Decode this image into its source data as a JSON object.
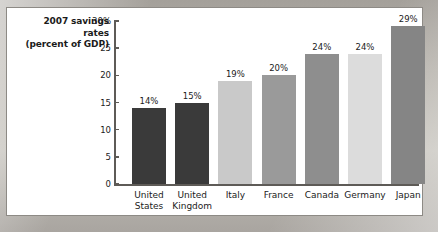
{
  "chart_data": {
    "type": "bar",
    "title": "2007 savings rates (percent of GDP)",
    "title_lines": [
      "2007 savings",
      "rates",
      "(percent of GDP)"
    ],
    "xlabel": "",
    "ylabel": "percent of GDP",
    "ylim": [
      0,
      30
    ],
    "yticks": [
      0,
      5,
      10,
      15,
      20,
      25,
      30
    ],
    "ytick_labels": [
      "0",
      "5",
      "10",
      "15",
      "20",
      "25",
      "30%"
    ],
    "grid": false,
    "legend": "none",
    "categories": [
      "United States",
      "United Kingdom",
      "Italy",
      "France",
      "Canada",
      "Germany",
      "Japan"
    ],
    "category_lines": [
      [
        "United",
        "States"
      ],
      [
        "United",
        "Kingdom"
      ],
      [
        "Italy",
        ""
      ],
      [
        "France",
        ""
      ],
      [
        "Canada",
        ""
      ],
      [
        "Germany",
        ""
      ],
      [
        "Japan",
        ""
      ]
    ],
    "values": [
      14,
      15,
      19,
      20,
      24,
      24,
      29
    ],
    "data_labels": [
      "14%",
      "15%",
      "19%",
      "20%",
      "24%",
      "24%",
      "29%"
    ],
    "bar_colors": [
      "#3a3a3a",
      "#3a3a3a",
      "#c9c9c9",
      "#9a9a9a",
      "#8e8e8e",
      "#dcdcdc",
      "#858585"
    ]
  },
  "colors": {
    "axis": "#5e5b57",
    "text": "#1b1b1b",
    "panel_background": "#ffffff",
    "page_background": "#b5b1aa"
  }
}
